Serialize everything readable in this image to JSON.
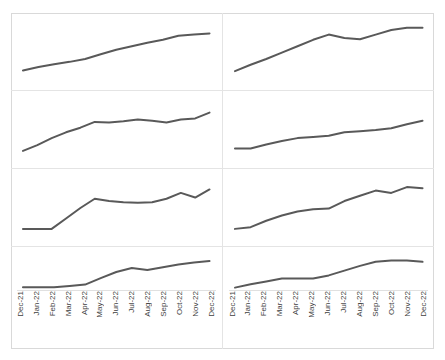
{
  "figure": {
    "title": "",
    "panel_count": 8,
    "layout": "2 columns x 4 rows small-multiples grid",
    "line_color": "#595959",
    "frame_color": "#d9d9d9",
    "grid_color": "#e4e4e4",
    "axis_rule_color": "#e0e0e0",
    "tick_label_color": "#3f3f3f",
    "background": "#ffffff"
  },
  "axis": {
    "categories": [
      "Dec-21",
      "Jan-22",
      "Feb-22",
      "Mar-22",
      "Apr-22",
      "May-22",
      "Jun-22",
      "Jul-22",
      "Aug-22",
      "Sep-22",
      "Oct-22",
      "Nov-22",
      "Dec-22"
    ],
    "label_rotation": "vertical",
    "ylim": [
      0,
      100
    ],
    "grid": false
  },
  "chart_data": [
    {
      "type": "line",
      "panel": "top-left",
      "title": "",
      "xlabel": "",
      "ylabel": "",
      "categories": [
        "Dec-21",
        "Jan-22",
        "Feb-22",
        "Mar-22",
        "Apr-22",
        "May-22",
        "Jun-22",
        "Jul-22",
        "Aug-22",
        "Sep-22",
        "Oct-22",
        "Nov-22",
        "Dec-22"
      ],
      "values": [
        18,
        24,
        29,
        33,
        38,
        46,
        54,
        60,
        66,
        71,
        78,
        80,
        82
      ],
      "ylim": [
        0,
        100
      ],
      "grid": false,
      "legend": "none"
    },
    {
      "type": "line",
      "panel": "top-right",
      "title": "",
      "xlabel": "",
      "ylabel": "",
      "categories": [
        "Dec-21",
        "Jan-22",
        "Feb-22",
        "Mar-22",
        "Apr-22",
        "May-22",
        "Jun-22",
        "Jul-22",
        "Aug-22",
        "Sep-22",
        "Oct-22",
        "Nov-22",
        "Dec-22"
      ],
      "values": [
        17,
        28,
        38,
        49,
        60,
        71,
        80,
        74,
        72,
        80,
        88,
        92,
        92
      ],
      "ylim": [
        0,
        100
      ],
      "grid": false,
      "legend": "none"
    },
    {
      "type": "line",
      "panel": "middle-upper-left",
      "title": "",
      "xlabel": "",
      "ylabel": "",
      "categories": [
        "Dec-21",
        "Jan-22",
        "Feb-22",
        "Mar-22",
        "Apr-22",
        "May-22",
        "Jun-22",
        "Jul-22",
        "Aug-22",
        "Sep-22",
        "Oct-22",
        "Nov-22",
        "Dec-22"
      ],
      "values": [
        14,
        24,
        36,
        46,
        54,
        64,
        63,
        65,
        68,
        66,
        63,
        68,
        70,
        80
      ],
      "ylim": [
        0,
        100
      ],
      "grid": false,
      "legend": "none"
    },
    {
      "type": "line",
      "panel": "middle-upper-right",
      "title": "",
      "xlabel": "",
      "ylabel": "",
      "categories": [
        "Dec-21",
        "Jan-22",
        "Feb-22",
        "Mar-22",
        "Apr-22",
        "May-22",
        "Jun-22",
        "Jul-22",
        "Aug-22",
        "Sep-22",
        "Oct-22",
        "Nov-22",
        "Dec-22"
      ],
      "values": [
        18,
        18,
        25,
        31,
        36,
        38,
        40,
        46,
        48,
        50,
        53,
        60,
        66
      ],
      "ylim": [
        0,
        100
      ],
      "grid": false,
      "legend": "none"
    },
    {
      "type": "line",
      "panel": "middle-lower-left",
      "title": "",
      "xlabel": "",
      "ylabel": "",
      "categories": [
        "Dec-21",
        "Jan-22",
        "Feb-22",
        "Mar-22",
        "Apr-22",
        "May-22",
        "Jun-22",
        "Jul-22",
        "Aug-22",
        "Sep-22",
        "Oct-22",
        "Nov-22",
        "Dec-22"
      ],
      "values": [
        14,
        14,
        14,
        32,
        50,
        66,
        62,
        60,
        59,
        60,
        66,
        76,
        68,
        82
      ],
      "ylim": [
        0,
        100
      ],
      "grid": false,
      "legend": "none"
    },
    {
      "type": "line",
      "panel": "middle-lower-right",
      "title": "",
      "xlabel": "",
      "ylabel": "",
      "categories": [
        "Dec-21",
        "Jan-22",
        "Feb-22",
        "Mar-22",
        "Apr-22",
        "May-22",
        "Jun-22",
        "Jul-22",
        "Aug-22",
        "Sep-22",
        "Oct-22",
        "Nov-22",
        "Dec-22"
      ],
      "values": [
        14,
        17,
        28,
        37,
        44,
        48,
        49,
        62,
        71,
        80,
        76,
        86,
        84
      ],
      "ylim": [
        0,
        100
      ],
      "grid": false,
      "legend": "none"
    },
    {
      "type": "line",
      "panel": "bottom-left",
      "title": "",
      "xlabel": "",
      "ylabel": "",
      "categories": [
        "Dec-21",
        "Jan-22",
        "Feb-22",
        "Mar-22",
        "Apr-22",
        "May-22",
        "Jun-22",
        "Jul-22",
        "Aug-22",
        "Sep-22",
        "Oct-22",
        "Nov-22",
        "Dec-22"
      ],
      "values": [
        5,
        5,
        5,
        9,
        13,
        32,
        50,
        62,
        56,
        64,
        72,
        78,
        82
      ],
      "ylim": [
        0,
        100
      ],
      "grid": false,
      "legend": "none"
    },
    {
      "type": "line",
      "panel": "bottom-right",
      "title": "",
      "xlabel": "",
      "ylabel": "",
      "categories": [
        "Dec-21",
        "Jan-22",
        "Feb-22",
        "Mar-22",
        "Apr-22",
        "May-22",
        "Jun-22",
        "Jul-22",
        "Aug-22",
        "Sep-22",
        "Oct-22",
        "Nov-22",
        "Dec-22"
      ],
      "values": [
        4,
        14,
        22,
        31,
        31,
        31,
        40,
        54,
        68,
        80,
        84,
        84,
        80
      ],
      "ylim": [
        0,
        100
      ],
      "grid": false,
      "legend": "none"
    }
  ]
}
